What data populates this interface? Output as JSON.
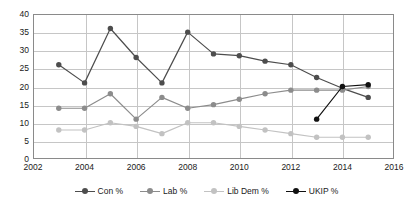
{
  "chart_data": {
    "type": "line",
    "title": "",
    "xlabel": "",
    "ylabel": "",
    "x": [
      2003,
      2004,
      2005,
      2006,
      2007,
      2008,
      2009,
      2010,
      2011,
      2012,
      2013,
      2014,
      2015
    ],
    "xlim": [
      2002,
      2016
    ],
    "ylim": [
      0,
      40
    ],
    "xticks": [
      "2002",
      "2004",
      "2006",
      "2008",
      "2010",
      "2012",
      "2014",
      "2016"
    ],
    "xtick_values": [
      2002,
      2004,
      2006,
      2008,
      2010,
      2012,
      2014,
      2016
    ],
    "yticks": [
      "0",
      "5",
      "10",
      "15",
      "20",
      "25",
      "30",
      "35",
      "40"
    ],
    "ytick_values": [
      0,
      5,
      10,
      15,
      20,
      25,
      30,
      35,
      40
    ],
    "grid": "horizontal-and-vertical",
    "legend_position": "bottom-center",
    "series": [
      {
        "name": "Con %",
        "color": "#4d4d4d",
        "x": [
          2003,
          2004,
          2005,
          2006,
          2007,
          2008,
          2009,
          2010,
          2011,
          2012,
          2013,
          2014,
          2015
        ],
        "values": [
          26,
          21,
          36,
          28,
          21,
          35,
          29,
          28.5,
          27,
          26,
          22.5,
          19.5,
          17
        ]
      },
      {
        "name": "Lab %",
        "color": "#8c8c8c",
        "x": [
          2003,
          2004,
          2005,
          2006,
          2007,
          2008,
          2009,
          2010,
          2011,
          2012,
          2013,
          2014,
          2015
        ],
        "values": [
          14,
          14,
          18,
          11,
          17,
          14,
          15,
          16.5,
          18,
          19,
          19,
          19,
          20
        ]
      },
      {
        "name": "Lib Dem %",
        "color": "#c2c2c2",
        "x": [
          2003,
          2004,
          2005,
          2006,
          2007,
          2008,
          2009,
          2010,
          2011,
          2012,
          2013,
          2014,
          2015
        ],
        "values": [
          8,
          8,
          10,
          9,
          7,
          10,
          10,
          9,
          8,
          7,
          6,
          6,
          6
        ]
      },
      {
        "name": "UKIP %",
        "color": "#111111",
        "x": [
          2013,
          2014,
          2015
        ],
        "values": [
          11,
          20,
          20.5
        ]
      }
    ]
  },
  "legend": {
    "items": [
      {
        "label": "Con %",
        "color": "#4d4d4d"
      },
      {
        "label": "Lab %",
        "color": "#8c8c8c"
      },
      {
        "label": "Lib Dem %",
        "color": "#c2c2c2"
      },
      {
        "label": "UKIP %",
        "color": "#111111"
      }
    ]
  }
}
